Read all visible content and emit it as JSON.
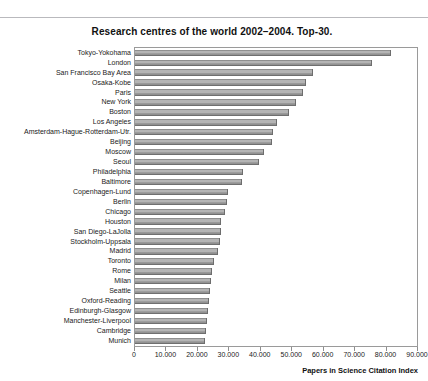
{
  "page": {
    "background_color": "#ffffff",
    "rule_color": "#b9b9bd"
  },
  "chart_data": {
    "type": "bar",
    "orientation": "horizontal",
    "title": "Research centres of the world 2002–2004. Top-30.",
    "xlabel": "Papers in Science Citation Index",
    "ylabel": "",
    "xlim": [
      0,
      90000
    ],
    "xticks": [
      0,
      10000,
      20000,
      30000,
      40000,
      50000,
      60000,
      70000,
      80000,
      90000
    ],
    "xticklabels": [
      "0",
      "10.000",
      "20.000",
      "30.000",
      "40.000",
      "50.000",
      "60.000",
      "70.000",
      "80.000",
      "90.000"
    ],
    "grid": false,
    "legend": null,
    "bar_color": "#a8a8a8",
    "bar_edge_color": "#6d6d6d",
    "categories": [
      "Tokyo-Yokohama",
      "London",
      "San Francisco Bay Area",
      "Osaka-Kobe",
      "Paris",
      "New York",
      "Boston",
      "Los Angeles",
      "Amsterdam-Hague-Rotterdam-Utr.",
      "Beijing",
      "Moscow",
      "Seoul",
      "Philadelphia",
      "Baltimore",
      "Copenhagen-Lund",
      "Berlin",
      "Chicago",
      "Houston",
      "San Diego-LaJolla",
      "Stockholm-Uppsala",
      "Madrid",
      "Toronto",
      "Rome",
      "Milan",
      "Seattle",
      "Oxford-Reading",
      "Edinburgh-Glasgow",
      "Manchester-Liverpool",
      "Cambridge",
      "Munich"
    ],
    "values": [
      81400,
      75400,
      56700,
      54500,
      53500,
      51300,
      49000,
      45000,
      44000,
      43500,
      41000,
      39500,
      34500,
      34000,
      29500,
      29300,
      28500,
      27500,
      27300,
      27000,
      26500,
      25000,
      24500,
      24300,
      24000,
      23500,
      23200,
      23000,
      22500,
      22300
    ]
  }
}
